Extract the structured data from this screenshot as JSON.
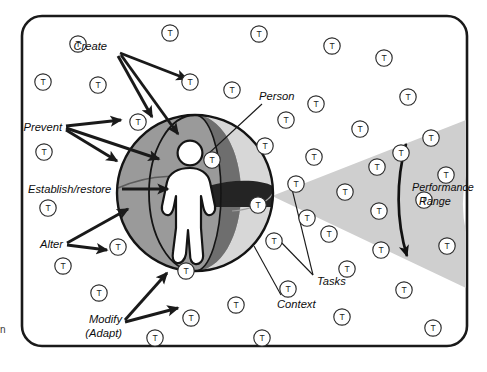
{
  "diagram": {
    "frame": {
      "shape": "rounded-rectangle",
      "x": 22,
      "y": 16,
      "width": 445,
      "height": 330,
      "radius": 20
    },
    "node_glyph": "T",
    "labels": {
      "create": "Create",
      "prevent": "Prevent",
      "establish_restore": "Establish/restore",
      "alter": "Alter",
      "modify_line1": "Modify",
      "modify_line2": "(Adapt)",
      "person": "Person",
      "tasks": "Tasks",
      "context": "Context",
      "performance_line1": "Performance",
      "performance_line2": "Range"
    },
    "caption_fragment": "n",
    "colors": {
      "outline": "#1a1a1a",
      "sphere_left": "#9a9a9a",
      "sphere_right": "#d7d7d7",
      "sphere_band_dark": "#6e6e6e",
      "sphere_equator": "#242424",
      "person_fill": "#ffffff",
      "cone_fill": "#cfcfcf",
      "background": "#ffffff",
      "text": "#0d0d0d"
    },
    "sphere": {
      "center_x": 195,
      "center_y": 193,
      "radius": 78,
      "description": "Sphere representing the person embedded in context, split by a dark vertical meridian band and a dark horizontal equatorial band"
    },
    "cone": {
      "apex_x": 272,
      "apex_y": 196,
      "description": "Light gray wedge fanning rightward from the sphere, denoting the performance range"
    },
    "tasks_nodes": [
      {
        "x": 78,
        "y": 44
      },
      {
        "x": 170,
        "y": 33
      },
      {
        "x": 259,
        "y": 34
      },
      {
        "x": 332,
        "y": 46
      },
      {
        "x": 43,
        "y": 82
      },
      {
        "x": 98,
        "y": 85
      },
      {
        "x": 190,
        "y": 82
      },
      {
        "x": 232,
        "y": 90
      },
      {
        "x": 384,
        "y": 58
      },
      {
        "x": 408,
        "y": 97
      },
      {
        "x": 138,
        "y": 122
      },
      {
        "x": 316,
        "y": 104
      },
      {
        "x": 44,
        "y": 152
      },
      {
        "x": 286,
        "y": 120
      },
      {
        "x": 360,
        "y": 129
      },
      {
        "x": 401,
        "y": 153
      },
      {
        "x": 265,
        "y": 146
      },
      {
        "x": 314,
        "y": 157
      },
      {
        "x": 431,
        "y": 138
      },
      {
        "x": 377,
        "y": 167
      },
      {
        "x": 48,
        "y": 208
      },
      {
        "x": 296,
        "y": 184
      },
      {
        "x": 345,
        "y": 192
      },
      {
        "x": 446,
        "y": 175
      },
      {
        "x": 118,
        "y": 247
      },
      {
        "x": 258,
        "y": 205
      },
      {
        "x": 307,
        "y": 218
      },
      {
        "x": 379,
        "y": 211
      },
      {
        "x": 63,
        "y": 266
      },
      {
        "x": 186,
        "y": 271
      },
      {
        "x": 274,
        "y": 241
      },
      {
        "x": 424,
        "y": 200
      },
      {
        "x": 99,
        "y": 293
      },
      {
        "x": 329,
        "y": 234
      },
      {
        "x": 347,
        "y": 269
      },
      {
        "x": 381,
        "y": 250
      },
      {
        "x": 191,
        "y": 318
      },
      {
        "x": 236,
        "y": 305
      },
      {
        "x": 288,
        "y": 289
      },
      {
        "x": 447,
        "y": 246
      },
      {
        "x": 262,
        "y": 338
      },
      {
        "x": 342,
        "y": 317
      },
      {
        "x": 404,
        "y": 290
      },
      {
        "x": 155,
        "y": 338
      },
      {
        "x": 433,
        "y": 328
      },
      {
        "x": 212,
        "y": 160
      }
    ]
  }
}
